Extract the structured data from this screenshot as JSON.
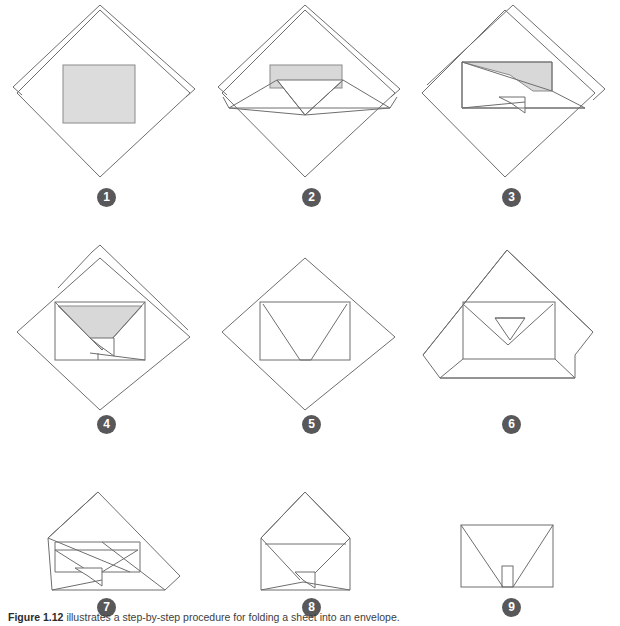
{
  "figure": {
    "background_color": "#ffffff",
    "line_color": "#6e6e6e",
    "paper_fill_color": "#dcdcdc",
    "badge_color": "#58585a",
    "badge_text_color": "#ffffff",
    "caption_label": "Figure 1.12",
    "caption_text": "illustrates a step-by-step procedure for folding a sheet into an envelope.",
    "caption_full": "Figure 1.12 illustrates a step-by-step procedure for folding a sheet into an envelope."
  },
  "steps": [
    {
      "number": "1",
      "name": "step-1",
      "description": "Square sheet oriented as a diamond with letter placed in the center"
    },
    {
      "number": "2",
      "name": "step-2",
      "description": "Bottom corner folded up to the center forming a V crease"
    },
    {
      "number": "3",
      "name": "step-3",
      "description": "Left corner folded inward across the face"
    },
    {
      "number": "4",
      "name": "step-4",
      "description": "Right corner folded inward so both side flaps overlap"
    },
    {
      "number": "5",
      "name": "step-5",
      "description": "Sheet turned over showing the rectangular back with V creases"
    },
    {
      "number": "6",
      "name": "step-6",
      "description": "Bottom flap folded up against the body of the envelope"
    },
    {
      "number": "7",
      "name": "step-7",
      "description": "Tilted view showing the assembled flaps before closing"
    },
    {
      "number": "8",
      "name": "step-8",
      "description": "Envelope with the top flap still open"
    },
    {
      "number": "9",
      "name": "step-9",
      "description": "Completed envelope sealed with a small tab"
    }
  ]
}
